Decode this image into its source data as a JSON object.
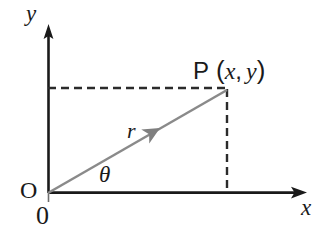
{
  "figure": {
    "background_color": "#ffffff",
    "axis_color": "#1a1a1a",
    "ray_color": "#808080",
    "dash_color": "#2b2b2b"
  },
  "labels": {
    "y_axis": "y",
    "x_axis": "x",
    "radius": "r",
    "angle": "θ",
    "origin_letter": "O",
    "origin_zero": "0",
    "point_name": "P",
    "point_open_paren": "(",
    "point_x": "x",
    "point_comma": ",",
    "point_y": "y",
    "point_close_paren": ")",
    "point_full": "P (x, y)"
  },
  "geometry": {
    "origin": {
      "x": 48,
      "y": 193
    },
    "point_p": {
      "x": 227,
      "y": 90
    },
    "y_axis_tip": {
      "x": 48,
      "y": 25
    },
    "x_axis_tip": {
      "x": 306,
      "y": 193
    },
    "ray_arrowhead_at": {
      "x": 155,
      "y": 133
    },
    "horizontal_dashed": {
      "x1": 48,
      "y1": 88,
      "x2": 227,
      "y2": 88
    },
    "vertical_dashed": {
      "x1": 227,
      "y1": 90,
      "x2": 227,
      "y2": 193
    },
    "angle_degrees": 30,
    "dash_pattern": "8 5"
  }
}
